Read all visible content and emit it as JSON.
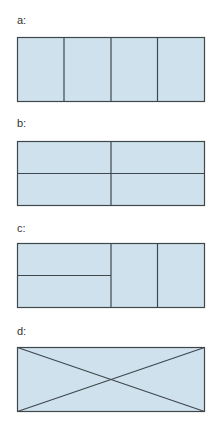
{
  "colors": {
    "fill": "#cfe1ec",
    "stroke": "#3f474d"
  },
  "figures": [
    {
      "label": "a:",
      "description": "rectangle divided into 4 equal vertical columns"
    },
    {
      "label": "b:",
      "description": "rectangle divided into 4 equal quadrants (2x2)"
    },
    {
      "label": "c:",
      "description": "left half split horizontally into 2; right half split into 2 vertical columns"
    },
    {
      "label": "d:",
      "description": "rectangle with both diagonals drawn"
    }
  ]
}
